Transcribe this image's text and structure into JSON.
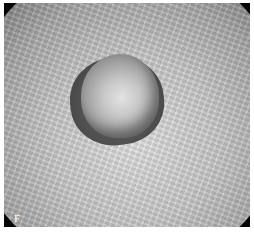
{
  "figure": {
    "panel_label": "F"
  }
}
